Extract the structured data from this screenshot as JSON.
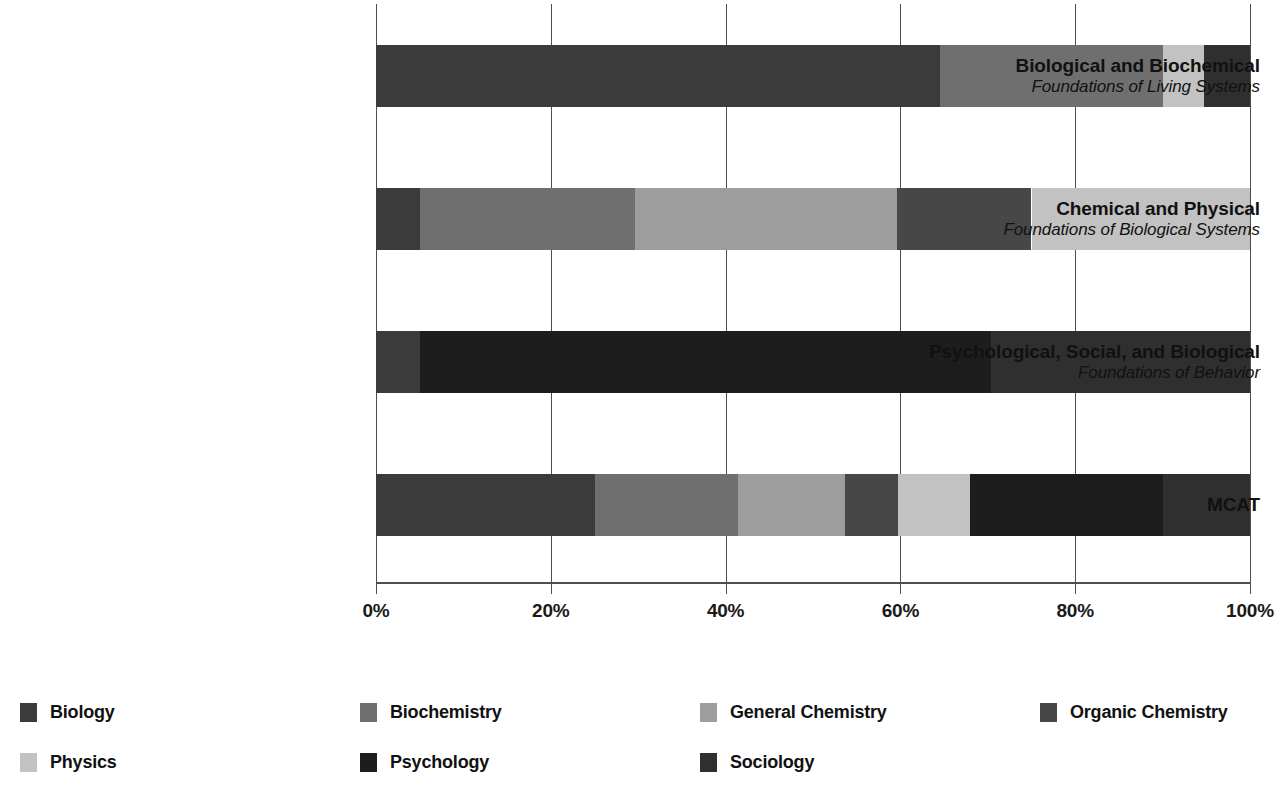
{
  "chart_data": {
    "type": "bar",
    "orientation": "horizontal",
    "stacked": true,
    "normalized_percent": true,
    "title": "",
    "xlabel": "",
    "ylabel": "",
    "xlim": [
      0,
      100
    ],
    "grid": true,
    "legend_position": "bottom",
    "x_tick_labels": [
      "0%",
      "20%",
      "40%",
      "60%",
      "80%",
      "100%"
    ],
    "x_tick_values": [
      0,
      20,
      40,
      60,
      80,
      100
    ],
    "categories": [
      {
        "line1": "Biological and Biochemical",
        "line2": "Foundations of Living Systems"
      },
      {
        "line1": "Chemical and Physical",
        "line2": "Foundations of Biological Systems"
      },
      {
        "line1": "Psychological, Social, and Biological",
        "line2": "Foundations of Behavior"
      },
      {
        "line1": "MCAT",
        "line2": ""
      }
    ],
    "series": [
      {
        "name": "Biology",
        "color": "#3b3b3b",
        "values": [
          64.5,
          5.0,
          5.0,
          25.0
        ]
      },
      {
        "name": "Biochemistry",
        "color": "#6f6f6f",
        "values": [
          25.5,
          24.6,
          0.0,
          16.4
        ]
      },
      {
        "name": "General Chemistry",
        "color": "#9d9d9d",
        "values": [
          0.0,
          30.0,
          0.0,
          12.3
        ]
      },
      {
        "name": "Organic Chemistry",
        "color": "#474747",
        "values": [
          0.0,
          15.4,
          0.0,
          6.0
        ]
      },
      {
        "name": "Physics",
        "color": "#c2c2c2",
        "values": [
          4.7,
          25.0,
          0.0,
          8.3
        ]
      },
      {
        "name": "Psychology",
        "color": "#1d1d1d",
        "values": [
          0.0,
          0.0,
          65.4,
          22.0
        ]
      },
      {
        "name": "Sociology",
        "color": "#2f2f2f",
        "values": [
          5.3,
          0.0,
          29.6,
          10.0
        ]
      }
    ]
  },
  "legend": {
    "entries": [
      {
        "label": "Biology",
        "color": "#3b3b3b"
      },
      {
        "label": "Biochemistry",
        "color": "#6f6f6f"
      },
      {
        "label": "General Chemistry",
        "color": "#9d9d9d"
      },
      {
        "label": "Organic Chemistry",
        "color": "#474747"
      },
      {
        "label": "Physics",
        "color": "#c2c2c2"
      },
      {
        "label": "Psychology",
        "color": "#1d1d1d"
      },
      {
        "label": "Sociology",
        "color": "#2f2f2f"
      }
    ]
  },
  "axis": {
    "gridline_color": "#4d4d4d"
  }
}
